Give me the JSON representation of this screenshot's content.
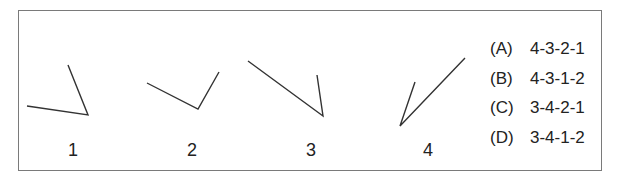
{
  "figure": {
    "angles": [
      {
        "label": "1",
        "points": [
          [
            27,
            106
          ],
          [
            88,
            115
          ],
          [
            68,
            65
          ]
        ],
        "label_x": 73
      },
      {
        "label": "2",
        "points": [
          [
            147,
            83
          ],
          [
            198,
            109
          ],
          [
            219,
            72
          ]
        ],
        "label_x": 192
      },
      {
        "label": "3",
        "points": [
          [
            248,
            61
          ],
          [
            323,
            116
          ],
          [
            317,
            75
          ]
        ],
        "label_x": 311
      },
      {
        "label": "4",
        "points": [
          [
            465,
            58
          ],
          [
            400,
            126
          ],
          [
            415,
            82
          ]
        ],
        "label_x": 428
      }
    ],
    "line_color": "#333333"
  },
  "options": [
    {
      "key": "(A)",
      "value": "4-3-2-1"
    },
    {
      "key": "(B)",
      "value": "4-3-1-2"
    },
    {
      "key": "(C)",
      "value": "3-4-2-1"
    },
    {
      "key": "(D)",
      "value": "3-4-1-2"
    }
  ]
}
